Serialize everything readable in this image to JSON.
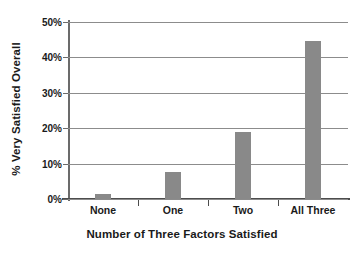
{
  "chart_data": {
    "type": "bar",
    "title": "",
    "categories": [
      "None",
      "One",
      "Two",
      "All Three"
    ],
    "values": [
      1.5,
      7.7,
      18.8,
      44.5
    ],
    "xlabel": "Number of Three Factors Satisfied",
    "ylabel": "% Very Satisfied Overall",
    "ylim": [
      0,
      50
    ],
    "ytick_labels": [
      "0%",
      "10%",
      "20%",
      "30%",
      "40%",
      "50%"
    ],
    "ytick_values": [
      0,
      10,
      20,
      30,
      40,
      50
    ],
    "grid": true,
    "legend": "none",
    "bar_color": "#898989",
    "axis_color": "#4d4d4d",
    "gridline_color": "#8c8c8c",
    "text_color": "#1a1a1a"
  }
}
